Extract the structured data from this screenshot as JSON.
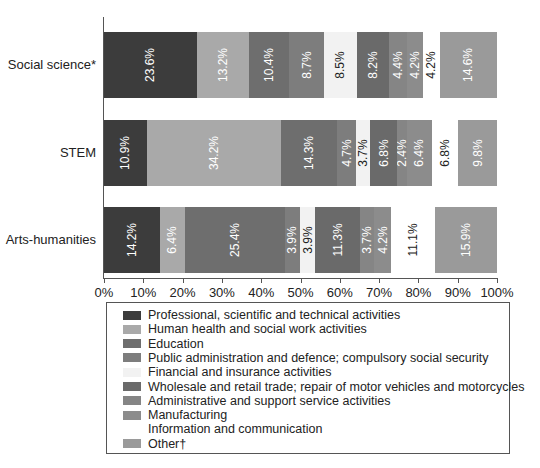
{
  "chart_data": {
    "type": "bar",
    "orientation": "horizontal-stacked-100",
    "title": "",
    "xlabel": "",
    "ylabel": "",
    "xlim": [
      0,
      100
    ],
    "x_ticks": [
      "0%",
      "10%",
      "20%",
      "30%",
      "40%",
      "50%",
      "60%",
      "70%",
      "80%",
      "90%",
      "100%"
    ],
    "grid": false,
    "legend_position": "bottom",
    "categories": [
      "Social science*",
      "STEM",
      "Arts-humanities"
    ],
    "series": [
      {
        "name": "Professional, scientific and technical activities",
        "color": "#3c3c3c",
        "label_color": "#ffffff",
        "values": [
          23.6,
          10.9,
          14.2
        ]
      },
      {
        "name": "Human health and social work activities",
        "color": "#a9a9a9",
        "label_color": "#ffffff",
        "values": [
          13.2,
          34.2,
          6.4
        ]
      },
      {
        "name": "Education",
        "color": "#6e6e6e",
        "label_color": "#ffffff",
        "values": [
          10.4,
          14.3,
          25.4
        ]
      },
      {
        "name": "Public administration and defence; compulsory social security",
        "color": "#7d7d7d",
        "label_color": "#ffffff",
        "values": [
          8.7,
          4.7,
          3.9
        ]
      },
      {
        "name": "Financial and insurance activities",
        "color": "#f2f2f2",
        "label_color": "#222222",
        "values": [
          8.5,
          3.7,
          3.9
        ]
      },
      {
        "name": "Wholesale and retail trade; repair of motor vehicles and motorcycles",
        "color": "#6a6a6a",
        "label_color": "#ffffff",
        "values": [
          8.2,
          6.8,
          11.3
        ]
      },
      {
        "name": "Administrative and support service activities",
        "color": "#858585",
        "label_color": "#ffffff",
        "values": [
          4.4,
          2.4,
          3.7
        ]
      },
      {
        "name": "Manufacturing",
        "color": "#8c8c8c",
        "label_color": "#ffffff",
        "values": [
          4.2,
          6.4,
          4.2
        ]
      },
      {
        "name": "Information and communication",
        "color": "#ffffff",
        "label_color": "#222222",
        "values": [
          4.2,
          6.8,
          11.1
        ]
      },
      {
        "name": "Other†",
        "color": "#9a9a9a",
        "label_color": "#ffffff",
        "values": [
          14.6,
          9.8,
          15.9
        ]
      }
    ],
    "value_labels": [
      [
        "23.6%",
        "13.2%",
        "10.4%",
        "8.7%",
        "8.5%",
        "8.2%",
        "4.4%",
        "4.2%",
        "4.2%",
        "14.6%"
      ],
      [
        "10.9%",
        "34.2%",
        "14.3%",
        "4.7%",
        "3.7%",
        "6.8%",
        "2.4%",
        "6.4%",
        "6.8%",
        "9.8%"
      ],
      [
        "14.2%",
        "6.4%",
        "25.4%",
        "3.9%",
        "3.9%",
        "11.3%",
        "3.7%",
        "4.2%",
        "11.1%",
        "15.9%"
      ]
    ]
  }
}
